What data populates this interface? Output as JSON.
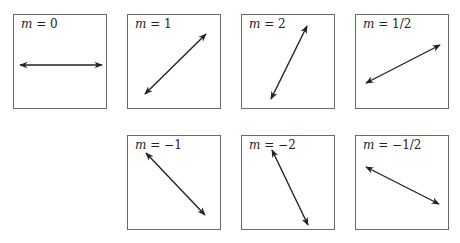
{
  "figure": {
    "panels": [
      {
        "id": "m0",
        "label_var": "m",
        "label_eq": " = 0",
        "slope": "0",
        "left": 13,
        "top": 14,
        "line": [
          6,
          50,
          88,
          50
        ]
      },
      {
        "id": "m1",
        "label_var": "m",
        "label_eq": " = 1",
        "slope": "1",
        "left": 127,
        "top": 14,
        "line": [
          17,
          79,
          78,
          19
        ]
      },
      {
        "id": "m2",
        "label_var": "m",
        "label_eq": " = 2",
        "slope": "2",
        "left": 241,
        "top": 14,
        "line": [
          29,
          84,
          65,
          11
        ]
      },
      {
        "id": "m1_2",
        "label_var": "m",
        "label_eq": " = 1/2",
        "slope": "1/2",
        "left": 355,
        "top": 14,
        "line": [
          10,
          68,
          84,
          30
        ]
      },
      {
        "id": "mneg1",
        "label_var": "m",
        "label_eq": " = −1",
        "slope": "-1",
        "left": 127,
        "top": 135,
        "line": [
          18,
          17,
          77,
          79
        ]
      },
      {
        "id": "mneg2",
        "label_var": "m",
        "label_eq": " = −2",
        "slope": "-2",
        "left": 241,
        "top": 135,
        "line": [
          30,
          14,
          66,
          89
        ]
      },
      {
        "id": "mneg1_2",
        "label_var": "m",
        "label_eq": " = −1/2",
        "slope": "-1/2",
        "left": 355,
        "top": 135,
        "line": [
          10,
          31,
          83,
          68
        ]
      }
    ]
  }
}
